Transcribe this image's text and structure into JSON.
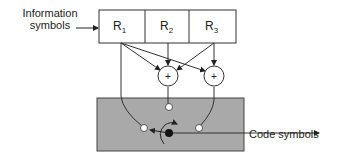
{
  "diagram": {
    "type": "convolutional-encoder",
    "input_label_line1": "Information",
    "input_label_line2": "symbols",
    "output_label": "Code symbols",
    "registers": [
      {
        "name": "R",
        "index": "1"
      },
      {
        "name": "R",
        "index": "2"
      },
      {
        "name": "R",
        "index": "3"
      }
    ],
    "adders": [
      {
        "symbol": "+"
      },
      {
        "symbol": "+"
      }
    ],
    "colors": {
      "commutator_box": "#a9a9a9",
      "lines": "#333333",
      "background": "#ffffff"
    }
  }
}
